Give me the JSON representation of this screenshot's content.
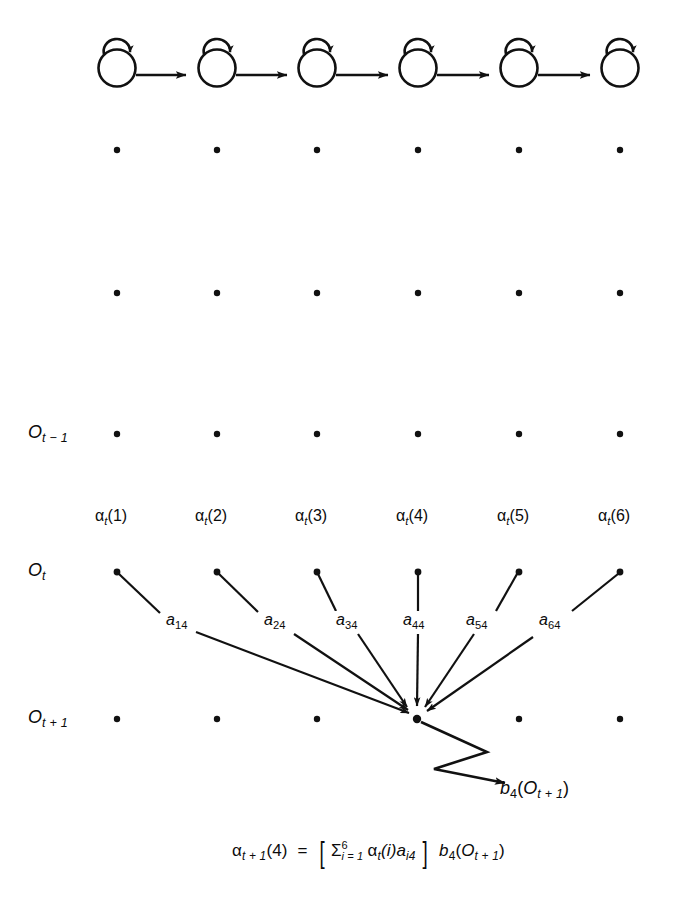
{
  "figure": {
    "background_color": "#ffffff",
    "ink_color": "#111111"
  },
  "markov_chain": {
    "description": "Left-to-right Markov chain of six states, each with a self-loop",
    "state_count": 6,
    "self_loop_icon": "self-loop-arc-icon",
    "transition_icon": "right-arrow-icon",
    "states": [
      {
        "index": 1,
        "cx": 117,
        "cy": 68,
        "has_self_loop": true,
        "has_forward_arrow": true
      },
      {
        "index": 2,
        "cx": 217,
        "cy": 68,
        "has_self_loop": true,
        "has_forward_arrow": true
      },
      {
        "index": 3,
        "cx": 317,
        "cy": 68,
        "has_self_loop": true,
        "has_forward_arrow": true
      },
      {
        "index": 4,
        "cx": 418,
        "cy": 68,
        "has_self_loop": true,
        "has_forward_arrow": true
      },
      {
        "index": 5,
        "cx": 519,
        "cy": 68,
        "has_self_loop": true,
        "has_forward_arrow": true
      },
      {
        "index": 6,
        "cx": 620,
        "cy": 68,
        "has_self_loop": true,
        "has_forward_arrow": false
      }
    ]
  },
  "lattice": {
    "columns_x": [
      117,
      217,
      317,
      418,
      519,
      620
    ],
    "rows": [
      {
        "key": "row_a",
        "y": 150,
        "label": "",
        "has_label": false
      },
      {
        "key": "row_b",
        "y": 293,
        "label": "",
        "has_label": false
      },
      {
        "key": "row_t_minus_1",
        "y": 434,
        "label": "O_t-1",
        "has_label": true
      },
      {
        "key": "row_t",
        "y": 572,
        "label": "O_t",
        "has_label": true
      },
      {
        "key": "row_t_plus_1",
        "y": 719,
        "label": "O_t+1",
        "has_label": true
      }
    ],
    "dot_radius": 3.2
  },
  "row_labels": {
    "t_minus_1": {
      "base": "O",
      "sub": "t − 1",
      "x": 28,
      "y": 434
    },
    "t": {
      "base": "O",
      "sub": "t",
      "x": 28,
      "y": 572
    },
    "t_plus_1": {
      "base": "O",
      "sub": "t + 1",
      "x": 28,
      "y": 719
    }
  },
  "alpha_labels": {
    "row_y": 518,
    "items": [
      {
        "greek": "α",
        "sub": "t",
        "arg": "(1)",
        "x": 117
      },
      {
        "greek": "α",
        "sub": "t",
        "arg": "(2)",
        "x": 217
      },
      {
        "greek": "α",
        "sub": "t",
        "arg": "(3)",
        "x": 317
      },
      {
        "greek": "α",
        "sub": "t",
        "arg": "(4)",
        "x": 418
      },
      {
        "greek": "α",
        "sub": "t",
        "arg": "(5)",
        "x": 519
      },
      {
        "greek": "α",
        "sub": "t",
        "arg": "(6)",
        "x": 620
      }
    ]
  },
  "transitions": {
    "target": {
      "x": 417,
      "y": 719,
      "state_index": 4
    },
    "arrows": [
      {
        "from_state": 1,
        "from_x": 117,
        "from_y": 572,
        "label_base": "a",
        "label_sub": "14",
        "label_x": 168,
        "label_y": 621
      },
      {
        "from_state": 2,
        "from_x": 217,
        "from_y": 572,
        "label_base": "a",
        "label_sub": "24",
        "label_x": 265,
        "label_y": 621
      },
      {
        "from_state": 3,
        "from_x": 317,
        "from_y": 572,
        "label_base": "a",
        "label_sub": "34",
        "label_x": 337,
        "label_y": 621
      },
      {
        "from_state": 4,
        "from_x": 418,
        "from_y": 572,
        "label_base": "a",
        "label_sub": "44",
        "label_x": 405,
        "label_y": 621
      },
      {
        "from_state": 5,
        "from_x": 519,
        "from_y": 572,
        "label_base": "a",
        "label_sub": "54",
        "label_x": 468,
        "label_y": 621
      },
      {
        "from_state": 6,
        "from_x": 620,
        "from_y": 572,
        "label_base": "a",
        "label_sub": "64",
        "label_x": 540,
        "label_y": 621
      }
    ]
  },
  "emission": {
    "zigzag_icon": "zigzag-arrow-icon",
    "label": {
      "base": "b",
      "sub": "4",
      "open": "(",
      "obs_base": "O",
      "obs_sub": "t + 1",
      "close": ")"
    },
    "label_x": 500,
    "label_y": 790
  },
  "equation": {
    "lhs_greek": "α",
    "lhs_sub": "t + 1",
    "lhs_arg": "(4)",
    "equals": "=",
    "bracket_open": "[",
    "sum_symbol": "Σ",
    "sum_upper": "6",
    "sum_lower": "i = 1",
    "term_greek": "α",
    "term_sub": "t",
    "term_arg": "(i)",
    "term_a": "a",
    "term_a_sub": "i4",
    "bracket_close": "]",
    "emission_b": "b",
    "emission_b_sub": "4",
    "emission_open": "(",
    "emission_obs": "O",
    "emission_obs_sub": "t + 1",
    "emission_close": ")",
    "x": 335,
    "y": 848
  }
}
